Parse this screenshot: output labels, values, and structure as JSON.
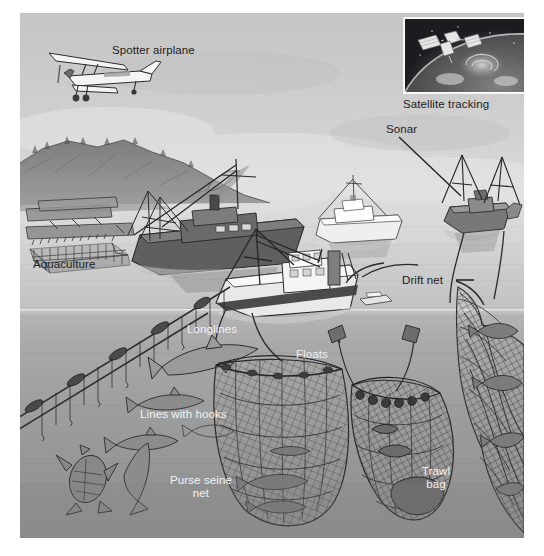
{
  "figure": {
    "type": "illustration-diagram",
    "palette": {
      "sky_top": "#c9c9c9",
      "sky_haze": "#dedede",
      "water_surface": "#b3b3b3",
      "water_deep": "#8e8e8e",
      "land": "#8a8a8a",
      "ink": "#2b2b2b",
      "label_dark": "#1d1d1d",
      "label_light": "#f2f2f2",
      "inset_space": "#0d0d12",
      "inset_earth": "#5d5d5d",
      "page_background": "#ffffff"
    },
    "waterline_y": 300,
    "labels": [
      {
        "id": "spotter-airplane",
        "text": "Spotter airplane",
        "x": 112,
        "y": 44,
        "tone": "dark",
        "align": "left"
      },
      {
        "id": "satellite-tracking",
        "text": "Satellite tracking",
        "x": 403,
        "y": 98,
        "tone": "dark",
        "align": "left"
      },
      {
        "id": "sonar",
        "text": "Sonar",
        "x": 386,
        "y": 123,
        "tone": "dark",
        "align": "left"
      },
      {
        "id": "aquaculture",
        "text": "Aquaculture",
        "x": 33,
        "y": 258,
        "tone": "dark",
        "align": "left"
      },
      {
        "id": "drift-net",
        "text": "Drift net",
        "x": 402,
        "y": 274,
        "tone": "dark",
        "align": "left"
      },
      {
        "id": "longlines",
        "text": "Longlines",
        "x": 187,
        "y": 323,
        "tone": "light",
        "align": "left"
      },
      {
        "id": "floats",
        "text": "Floats",
        "x": 296,
        "y": 348,
        "tone": "light",
        "align": "left"
      },
      {
        "id": "lines-with-hooks",
        "text": "Lines with hooks",
        "x": 140,
        "y": 408,
        "tone": "light",
        "align": "left"
      },
      {
        "id": "purse-seine-net",
        "text": "Purse seine\nnet",
        "x": 165,
        "y": 474,
        "tone": "light",
        "align": "center"
      },
      {
        "id": "trawl-bag",
        "text": "Trawl\nbag",
        "x": 412,
        "y": 465,
        "tone": "light",
        "align": "center"
      }
    ],
    "leaders": [
      {
        "id": "sonar-leader",
        "from": [
          399,
          137
        ],
        "to": [
          461,
          196
        ]
      },
      {
        "id": "drift-net-leader",
        "from": [
          456,
          280
        ],
        "to": [
          474,
          280
        ]
      }
    ],
    "scene_elements": [
      {
        "id": "spotter-airplane-drawing",
        "kind": "aircraft",
        "label": "Spotter airplane"
      },
      {
        "id": "satellite-inset",
        "kind": "photo-inset",
        "label": "Satellite tracking"
      },
      {
        "id": "coastline",
        "kind": "landform",
        "label": "Shoreline with hills"
      },
      {
        "id": "aquaculture-pens",
        "kind": "structure",
        "label": "Aquaculture pens and dock"
      },
      {
        "id": "trawler-left",
        "kind": "vessel",
        "label": "Trawler with smokestack"
      },
      {
        "id": "vessel-center-white",
        "kind": "vessel",
        "label": "White survey vessel"
      },
      {
        "id": "seiner-foreground",
        "kind": "vessel",
        "label": "Purse seiner"
      },
      {
        "id": "drift-net-boats",
        "kind": "vessel",
        "label": "Drift net boats"
      },
      {
        "id": "longline-rig",
        "kind": "gear",
        "label": "Longline with baited hooks"
      },
      {
        "id": "purse-seine-gear",
        "kind": "gear",
        "label": "Purse seine net"
      },
      {
        "id": "trawl-gear",
        "kind": "gear",
        "label": "Trawl net and bag"
      },
      {
        "id": "drift-net-gear",
        "kind": "gear",
        "label": "Drift net curtain"
      },
      {
        "id": "caught-fish",
        "kind": "fauna",
        "label": "Hooked fish, shark and sea turtle"
      }
    ]
  }
}
